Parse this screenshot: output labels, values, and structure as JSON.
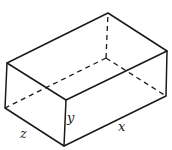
{
  "diagram": {
    "type": "rectangular-box-3d",
    "labels": {
      "x": "x",
      "y": "y",
      "z": "z"
    },
    "colors": {
      "line": "#1a1a1a",
      "background": "#ffffff"
    }
  }
}
